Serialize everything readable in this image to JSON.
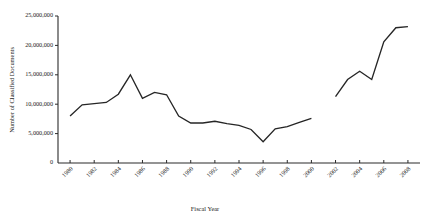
{
  "chart_data": {
    "type": "line",
    "title": "",
    "xlabel": "Fiscal Year",
    "ylabel": "Number of Classified Documents",
    "xlim": [
      1979,
      2009
    ],
    "ylim": [
      0,
      25000000
    ],
    "grid": false,
    "legend": "none",
    "x_tick_labels": [
      "1980",
      "1982",
      "1984",
      "1986",
      "1988",
      "1990",
      "1992",
      "1994",
      "1996",
      "1998",
      "2000",
      "2002",
      "2004",
      "2006",
      "2008"
    ],
    "x_tick_values": [
      1980,
      1982,
      1984,
      1986,
      1988,
      1990,
      1992,
      1994,
      1996,
      1998,
      2000,
      2002,
      2004,
      2006,
      2008
    ],
    "y_tick_labels": [
      "0",
      "5,000,000",
      "10,000,000",
      "15,000,000",
      "20,000,000",
      "25,000,000"
    ],
    "y_tick_values": [
      0,
      5000000,
      10000000,
      15000000,
      20000000,
      25000000
    ],
    "origin_label": "0",
    "series": [
      {
        "name": "Classified Documents (1980-2000)",
        "x": [
          1980,
          1981,
          1982,
          1983,
          1984,
          1985,
          1986,
          1987,
          1988,
          1989,
          1990,
          1991,
          1992,
          1993,
          1994,
          1995,
          1996,
          1997,
          1998,
          1999,
          2000
        ],
        "values": [
          8000000,
          9900000,
          10100000,
          10300000,
          11700000,
          15000000,
          11000000,
          12000000,
          11600000,
          8000000,
          6800000,
          6800000,
          7100000,
          6700000,
          6400000,
          5700000,
          3600000,
          5800000,
          6200000,
          6900000,
          7600000
        ]
      },
      {
        "name": "Classified Documents (2002-2008)",
        "x": [
          2002,
          2003,
          2004,
          2005,
          2006,
          2007,
          2008
        ],
        "values": [
          11300000,
          14200000,
          15600000,
          14200000,
          20600000,
          23000000,
          23200000
        ]
      }
    ]
  }
}
